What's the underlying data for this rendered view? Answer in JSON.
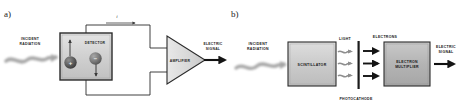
{
  "figure": {
    "title": "",
    "panels": [
      {
        "id": "a",
        "label": "a)",
        "items": {
          "incident_radiation_line1": "INCIDENT",
          "incident_radiation_line2": "RADIATION",
          "detector": "DETECTOR",
          "current_symbol": "i",
          "amplifier": "AMPLIFIER",
          "electric_signal_line1": "ELECTRIC",
          "electric_signal_line2": "SIGNAL",
          "charge_positive": "+",
          "charge_negative": "−"
        }
      },
      {
        "id": "b",
        "label": "b)",
        "items": {
          "incident_radiation_line1": "INCIDENT",
          "incident_radiation_line2": "RADIATION",
          "scintillator": "SCINTILLATOR",
          "light": "LIGHT",
          "electrons": "ELECTRONS",
          "photocathode": "PHOTOCATHODE",
          "electron_multiplier_line1": "ELECTRON",
          "electron_multiplier_line2": "MULTIPLIER",
          "electric_signal_line1": "ELECTRIC",
          "electric_signal_line2": "SIGNAL"
        }
      }
    ],
    "colors": {
      "background": "#ffffff",
      "stroke": "#2b2b2b",
      "box_fill_light": "#d9d9d9",
      "box_fill_mid": "#b9b9b9",
      "text": "#1a1a1a",
      "wave": "#b0b0b0"
    }
  }
}
